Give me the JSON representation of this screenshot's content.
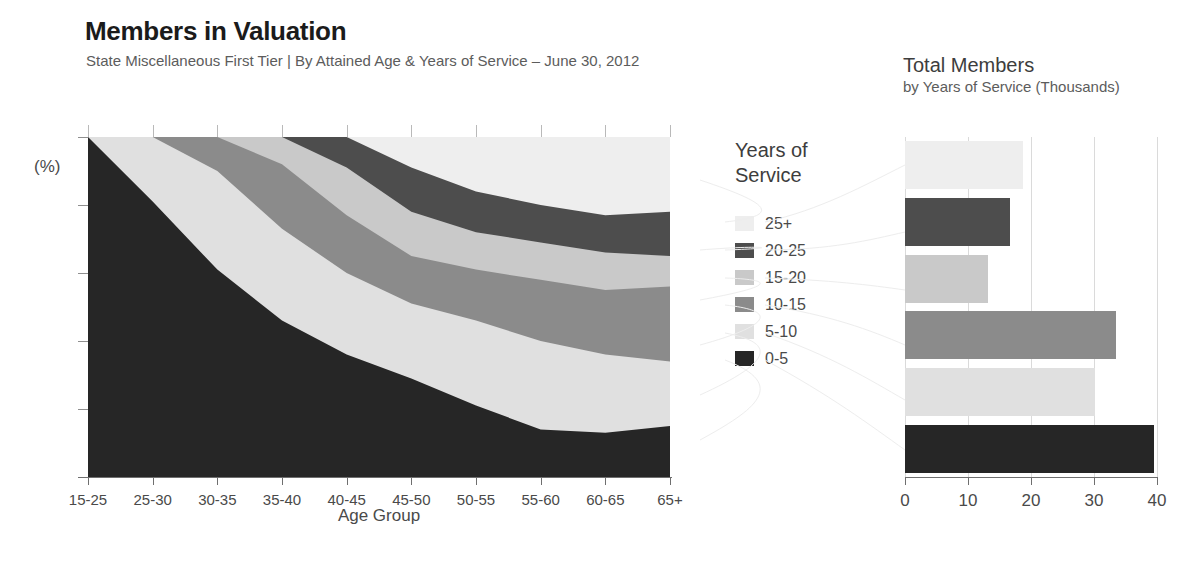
{
  "header": {
    "title": "Members in Valuation",
    "subtitle": "State Miscellaneous First Tier | By Attained Age & Years of Service – June 30, 2012"
  },
  "panel2": {
    "title": "Total Members",
    "subtitle": "by Years of Service (Thousands)"
  },
  "legend": {
    "title_line1": "Years of",
    "title_line2": "Service",
    "items": [
      {
        "label": "25+",
        "color": "#eeeeee"
      },
      {
        "label": "20-25",
        "color": "#4d4d4d"
      },
      {
        "label": "15-20",
        "color": "#c9c9c9"
      },
      {
        "label": "10-15",
        "color": "#8b8b8b"
      },
      {
        "label": "5-10",
        "color": "#e0e0e0"
      },
      {
        "label": "0-5",
        "color": "#262626"
      }
    ]
  },
  "colors": {
    "band_25plus": "#eeeeee",
    "band_20_25": "#4d4d4d",
    "band_15_20": "#c9c9c9",
    "band_10_15": "#8b8b8b",
    "band_5_10": "#e0e0e0",
    "band_0_5": "#262626",
    "axis": "#6f6f6f",
    "gridline": "#dadada",
    "text": "#4a4a4a",
    "title": "#1b1b1b"
  },
  "chart_data": [
    {
      "type": "area",
      "id": "members-by-age-stacked-area",
      "title": "Members in Valuation",
      "subtitle": "State Miscellaneous First Tier | By Attained Age & Years of Service – June 30, 2012",
      "xlabel": "Age Group",
      "ylabel": "(%)",
      "ylim": [
        0,
        100
      ],
      "yticks": [
        0,
        20,
        40,
        60,
        80,
        100
      ],
      "grid": true,
      "legend_position": "right",
      "stacked": true,
      "normalized_percent": true,
      "categories": [
        "15-25",
        "25-30",
        "30-35",
        "35-40",
        "40-45",
        "45-50",
        "50-55",
        "55-60",
        "60-65",
        "65+"
      ],
      "series": [
        {
          "name": "0-5",
          "color": "#262626",
          "values": [
            100,
            81,
            61,
            46,
            36,
            29,
            21,
            14,
            13,
            15
          ]
        },
        {
          "name": "5-10",
          "color": "#e0e0e0",
          "values": [
            0,
            19,
            29,
            27,
            24,
            22,
            25,
            26,
            23,
            19
          ]
        },
        {
          "name": "10-15",
          "color": "#8b8b8b",
          "values": [
            0,
            0,
            10,
            19,
            17,
            14,
            15,
            18,
            19,
            22
          ]
        },
        {
          "name": "15-20",
          "color": "#c9c9c9",
          "values": [
            0,
            0,
            0,
            8,
            14,
            13,
            11,
            11,
            11,
            9
          ]
        },
        {
          "name": "20-25",
          "color": "#4d4d4d",
          "values": [
            0,
            0,
            0,
            0,
            9,
            13,
            12,
            11,
            11,
            13
          ]
        },
        {
          "name": "25+",
          "color": "#eeeeee",
          "values": [
            0,
            0,
            0,
            0,
            0,
            9,
            16,
            20,
            23,
            22
          ]
        }
      ],
      "cumulative_tops": [
        [
          100,
          100,
          100,
          100,
          100,
          100
        ],
        [
          81,
          100,
          100,
          100,
          100,
          100
        ],
        [
          61,
          90,
          100,
          100,
          100,
          100
        ],
        [
          46,
          73,
          92,
          100,
          100,
          100
        ],
        [
          36,
          60,
          77,
          91,
          100,
          100
        ],
        [
          29,
          51,
          65,
          78,
          91,
          100
        ],
        [
          21,
          46,
          61,
          72,
          84,
          100
        ],
        [
          14,
          40,
          58,
          69,
          80,
          100
        ],
        [
          13,
          36,
          55,
          66,
          77,
          100
        ],
        [
          15,
          34,
          56,
          65,
          78,
          100
        ]
      ]
    },
    {
      "type": "bar",
      "id": "total-members-by-years-of-service",
      "orientation": "horizontal",
      "title": "Total Members",
      "subtitle": "by Years of Service (Thousands)",
      "xlabel": "",
      "ylabel": "",
      "xlim": [
        0,
        40
      ],
      "xticks": [
        0,
        10,
        20,
        30,
        40
      ],
      "grid": true,
      "categories": [
        "25+",
        "20-25",
        "15-20",
        "10-15",
        "5-10",
        "0-5"
      ],
      "values": [
        18.8,
        16.6,
        13.2,
        33.5,
        30.2,
        39.5
      ],
      "colors": [
        "#eeeeee",
        "#4d4d4d",
        "#c9c9c9",
        "#8b8b8b",
        "#e0e0e0",
        "#262626"
      ]
    }
  ]
}
